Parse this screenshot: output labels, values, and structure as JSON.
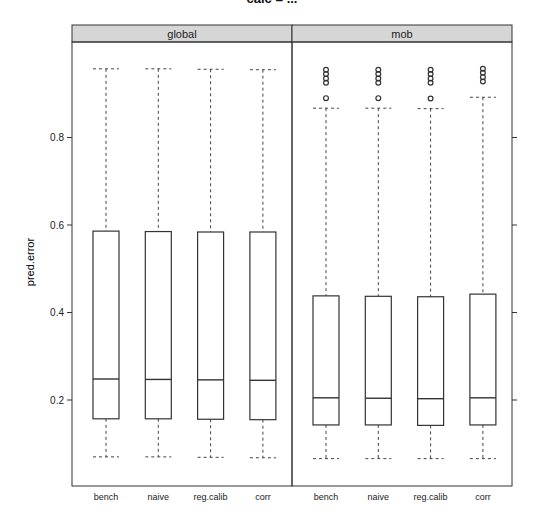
{
  "chart_data": {
    "type": "boxplot",
    "title": "calc = ...",
    "xlabel": "",
    "ylabel": "pred.error",
    "ylim": [
      0.04,
      1.0
    ],
    "yticks": [
      0.2,
      0.4,
      0.6,
      0.8
    ],
    "ytick_labels": [
      "0.2",
      "0.4",
      "0.6",
      "0.8"
    ],
    "grid": false,
    "legend": null,
    "categories": [
      "bench",
      "naive",
      "reg.calib",
      "corr"
    ],
    "panels": [
      {
        "strip": "global",
        "boxes": [
          {
            "category": "bench",
            "lower_whisker": 0.07,
            "q1": 0.157,
            "median": 0.248,
            "q3": 0.586,
            "upper_whisker": 0.957,
            "outliers": []
          },
          {
            "category": "naive",
            "lower_whisker": 0.07,
            "q1": 0.157,
            "median": 0.247,
            "q3": 0.585,
            "upper_whisker": 0.957,
            "outliers": []
          },
          {
            "category": "reg.calib",
            "lower_whisker": 0.069,
            "q1": 0.156,
            "median": 0.246,
            "q3": 0.584,
            "upper_whisker": 0.956,
            "outliers": []
          },
          {
            "category": "corr",
            "lower_whisker": 0.068,
            "q1": 0.155,
            "median": 0.245,
            "q3": 0.584,
            "upper_whisker": 0.955,
            "outliers": []
          }
        ]
      },
      {
        "strip": "mob",
        "boxes": [
          {
            "category": "bench",
            "lower_whisker": 0.066,
            "q1": 0.143,
            "median": 0.205,
            "q3": 0.438,
            "upper_whisker": 0.867,
            "outliers": [
              0.89,
              0.925,
              0.935,
              0.945,
              0.955
            ]
          },
          {
            "category": "naive",
            "lower_whisker": 0.066,
            "q1": 0.143,
            "median": 0.204,
            "q3": 0.437,
            "upper_whisker": 0.867,
            "outliers": [
              0.89,
              0.925,
              0.935,
              0.945,
              0.955
            ]
          },
          {
            "category": "reg.calib",
            "lower_whisker": 0.066,
            "q1": 0.142,
            "median": 0.203,
            "q3": 0.436,
            "upper_whisker": 0.866,
            "outliers": [
              0.889,
              0.925,
              0.935,
              0.945,
              0.955
            ]
          },
          {
            "category": "corr",
            "lower_whisker": 0.066,
            "q1": 0.143,
            "median": 0.205,
            "q3": 0.442,
            "upper_whisker": 0.892,
            "outliers": [
              0.928,
              0.938,
              0.948,
              0.957
            ]
          }
        ]
      }
    ]
  },
  "colors": {
    "strip_bg": "#d6d6d6",
    "frame": "#333333",
    "box": "#333333",
    "whisker": "#444444"
  }
}
